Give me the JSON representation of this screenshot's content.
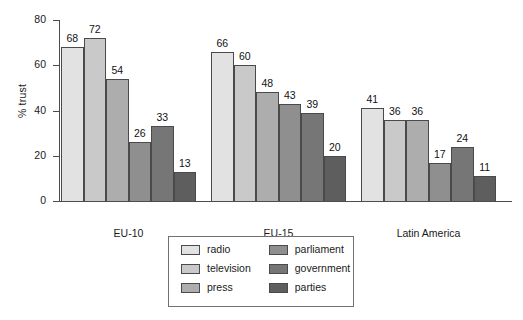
{
  "chart_data": {
    "type": "bar",
    "title": "",
    "subtitle": "",
    "xlabel": "",
    "ylabel": "% trust",
    "ylim": [
      0,
      80
    ],
    "yticks": [
      0,
      20,
      40,
      60,
      80
    ],
    "grid": false,
    "legend_position": "bottom-center",
    "legend_columns": 2,
    "categories": [
      "EU-10",
      "EU-15",
      "Latin America"
    ],
    "series": [
      {
        "name": "radio",
        "values": [
          68,
          66,
          41
        ],
        "color": "#e2e2e2"
      },
      {
        "name": "television",
        "values": [
          72,
          60,
          36
        ],
        "color": "#c9c9c9"
      },
      {
        "name": "press",
        "values": [
          54,
          48,
          36
        ],
        "color": "#adadad"
      },
      {
        "name": "parliament",
        "values": [
          26,
          43,
          17
        ],
        "color": "#8f8f8f"
      },
      {
        "name": "government",
        "values": [
          33,
          39,
          24
        ],
        "color": "#767676"
      },
      {
        "name": "parties",
        "values": [
          13,
          20,
          11
        ],
        "color": "#5e5e5e"
      }
    ],
    "data_labels": {
      "EU-10": [
        68,
        72,
        54,
        26,
        33,
        13
      ],
      "EU-15": [
        66,
        60,
        48,
        43,
        39,
        20
      ],
      "Latin America": [
        41,
        36,
        36,
        17,
        24,
        11
      ]
    },
    "axis_color": "#4d4d4d",
    "bar_edge_color": "#4a4a4a",
    "background_color": "#ffffff"
  }
}
